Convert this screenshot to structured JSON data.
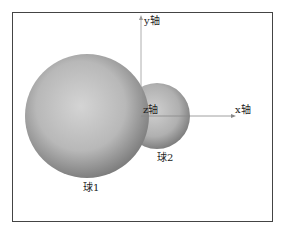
{
  "figure": {
    "axes": {
      "y_label": "y轴",
      "x_label": "x轴",
      "z_label": "z轴"
    },
    "spheres": [
      {
        "label": "球1"
      },
      {
        "label": "球2"
      }
    ],
    "caption": "……"
  }
}
